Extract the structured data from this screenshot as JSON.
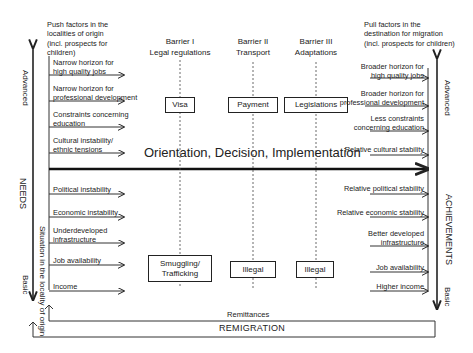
{
  "diagram": {
    "push_header": "Push factors in the localities of origin (incl. prospects for children)",
    "push_header_lines": [
      "Push factors in the",
      "localities of origin",
      "(incl. prospects for",
      "children)"
    ],
    "pull_header_lines": [
      "Pull factors in the",
      "destination for migration",
      "(incl. prospects for children)"
    ],
    "barriers": [
      {
        "title": "Barrier I",
        "subtitle": "Legal regulations",
        "top_box": "Visa",
        "bottom_box": [
          "Smuggling/",
          "Trafficking"
        ]
      },
      {
        "title": "Barrier II",
        "subtitle": "Transport",
        "top_box": "Payment",
        "bottom_box": [
          "Illegal"
        ]
      },
      {
        "title": "Barrier III",
        "subtitle": "Adaptations",
        "top_box": "Legislations",
        "bottom_box": [
          "Illegal"
        ]
      }
    ],
    "push_factors": [
      [
        "Narrow horizon for",
        "high quality jobs"
      ],
      [
        "Narrow horizon for",
        "professional development"
      ],
      [
        "Constraints concerning",
        "education"
      ],
      [
        "Cultural instability/",
        "ethnic tensions"
      ],
      [
        "Political instability"
      ],
      [
        "Economic instability"
      ],
      [
        "Underdeveloped",
        "infrastructure"
      ],
      [
        "Job availability"
      ],
      [
        "Income"
      ]
    ],
    "pull_factors": [
      [
        "Broader horizon for",
        "high quality jobs"
      ],
      [
        "Broader horizon for",
        "professional development"
      ],
      [
        "Less constraints",
        "concerning education"
      ],
      [
        "Relative cultural stability"
      ],
      [
        "Relative political stability"
      ],
      [
        "Relative economic stability"
      ],
      [
        "Better developed",
        "infrastructure"
      ],
      [
        "Job availability"
      ],
      [
        "Higher income"
      ]
    ],
    "center_label": "Orientation, Decision, Implementation",
    "left_axis": {
      "top": "Advanced",
      "middle": "NEEDS",
      "bottom": "Basic",
      "inner": "Situation in the locality of origin"
    },
    "right_axis": {
      "top": "Advanced",
      "middle": "ACHIEVEMENTS",
      "bottom": "Basic"
    },
    "remittances": "Remittances",
    "remigration": "REMIGRATION"
  }
}
